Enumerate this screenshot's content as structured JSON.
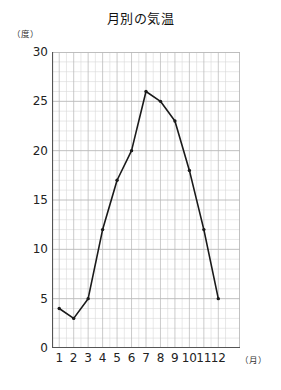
{
  "chart_data": {
    "type": "line",
    "title": "月別の気温",
    "xlabel": "（月）",
    "ylabel": "（度）",
    "categories": [
      "1",
      "2",
      "3",
      "4",
      "5",
      "6",
      "7",
      "8",
      "9",
      "10",
      "11",
      "12"
    ],
    "values": [
      4,
      3,
      5,
      12,
      17,
      20,
      26,
      25,
      23,
      18,
      12,
      5
    ],
    "series": [
      {
        "name": "気温",
        "values": [
          4,
          3,
          5,
          12,
          17,
          20,
          26,
          25,
          23,
          18,
          12,
          5
        ]
      }
    ],
    "ylim": [
      0,
      30
    ],
    "yticks": [
      "0",
      "5",
      "10",
      "15",
      "20",
      "25",
      "30"
    ],
    "ytick_values": [
      0,
      5,
      10,
      15,
      20,
      25,
      30
    ],
    "y_major_step": 5,
    "y_minor_step": 1,
    "grid": true,
    "legend": "none",
    "line_color": "#1a1a1a",
    "marker": "dot",
    "grid_color": "#b9b9b9",
    "grid_minor_color": "#d8d8d8",
    "axis_color": "#555555"
  }
}
